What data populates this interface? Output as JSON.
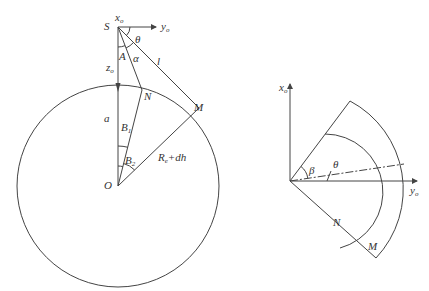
{
  "left_figure": {
    "labels": {
      "S": "S",
      "x_o": "x",
      "x_o_sub": "o",
      "y_o": "y",
      "y_o_sub": "o",
      "theta": "θ",
      "A": "A",
      "alpha": "α",
      "l": "l",
      "z_o": "z",
      "z_o_sub": "o",
      "N": "N",
      "M": "M",
      "a": "a",
      "B1": "B",
      "B1_sub": "1",
      "B2": "B",
      "B2_sub": "2",
      "R": "R",
      "R_sub": "e",
      "R_plus": "+dh",
      "O": "O"
    }
  },
  "right_figure": {
    "labels": {
      "x_o": "x",
      "x_o_sub": "o",
      "y_o": "y",
      "y_o_sub": "o",
      "beta": "β",
      "theta": "θ",
      "N": "N",
      "M": "M"
    }
  }
}
